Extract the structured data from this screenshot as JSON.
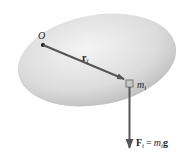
{
  "diagram": {
    "origin_label": "O",
    "position_vector": {
      "symbol": "r",
      "subscript": "i"
    },
    "mass_element": {
      "symbol": "m",
      "subscript": "i"
    },
    "force": {
      "lhs_symbol": "F",
      "lhs_subscript": "i",
      "equals": "=",
      "rhs_symbol": "m",
      "rhs_subscript": "i",
      "rhs_vector": "g"
    },
    "colors": {
      "body_fill_light": "#f2f2f2",
      "body_fill_dark": "#b8b8b8",
      "arrow": "#555555",
      "mass_box": "#8a8a8a"
    }
  }
}
